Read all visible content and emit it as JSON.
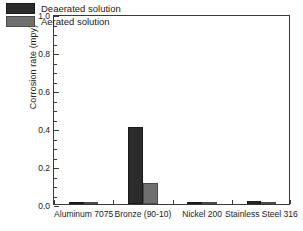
{
  "chart_data": {
    "type": "bar",
    "title": "",
    "xlabel": "",
    "ylabel": "Corrosion rate (mpy)",
    "categories": [
      "Aluminum 7075",
      "Bronze (90-10)",
      "Nickel 200",
      "Stainless Steel 316"
    ],
    "series": [
      {
        "name": "Deaerated solution",
        "color": "#2b2b2b",
        "values": [
          0.008,
          0.405,
          0.004,
          0.015
        ]
      },
      {
        "name": "Aerated solution",
        "color": "#6f6f6f",
        "values": [
          0.008,
          0.11,
          0.004,
          0.013
        ]
      }
    ],
    "ylim": [
      0.0,
      1.0
    ],
    "ytick_labels": [
      "0.0",
      "0.2",
      "0.4",
      "0.6",
      "0.8",
      "1.0"
    ],
    "ytick_values": [
      0.0,
      0.2,
      0.4,
      0.6,
      0.8,
      1.0
    ],
    "yminor_step": 0.05,
    "grid": false,
    "legend_position": "upper-left-inside"
  }
}
